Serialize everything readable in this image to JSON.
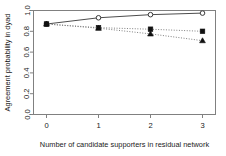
{
  "chart_data": {
    "type": "line",
    "title": "",
    "xlabel": "Number of candidate supporters in residual network",
    "ylabel": "Agreement probability in dyad",
    "x": [
      0,
      1,
      2,
      3
    ],
    "xlim": [
      -0.25,
      3.25
    ],
    "ylim": [
      0.0,
      1.0
    ],
    "xticks": [
      "0",
      "1",
      "2",
      "3"
    ],
    "yticks": [
      "0.0",
      "0.2",
      "0.4",
      "0.6",
      "0.8",
      "1.0"
    ],
    "ytick_values": [
      0.0,
      0.2,
      0.4,
      0.6,
      0.8,
      1.0
    ],
    "grid": false,
    "legend": "none",
    "series": [
      {
        "name": "open-circle-series",
        "marker": "open-circle",
        "linestyle": "solid",
        "color": "#4d4d4d",
        "values": [
          0.87,
          0.93,
          0.96,
          0.975
        ]
      },
      {
        "name": "filled-square-series",
        "marker": "filled-square",
        "linestyle": "dotted",
        "color": "#808080",
        "values": [
          0.87,
          0.835,
          0.82,
          0.8
        ]
      },
      {
        "name": "filled-triangle-series",
        "marker": "filled-triangle",
        "linestyle": "dotted",
        "color": "#808080",
        "values": [
          0.87,
          0.83,
          0.775,
          0.71
        ]
      }
    ]
  },
  "axes": {
    "frame_color": "#808080"
  }
}
